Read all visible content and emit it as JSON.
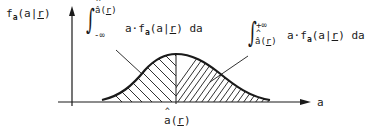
{
  "diagram": {
    "y_axis_label": {
      "fn": "f",
      "sub": "a",
      "args_pre": "(a|",
      "arg_r": "r",
      "args_post": ")"
    },
    "x_axis_label": "a",
    "split_label": {
      "base": "a",
      "open": "(",
      "arg": "r",
      "close": ")"
    },
    "left_integral": {
      "upper": "â(r)",
      "upper_base": "â(",
      "upper_arg": "r",
      "upper_close": ")",
      "lower": "-∞",
      "integrand_pre": "a·f",
      "integrand_sub": "a",
      "integrand_args_pre": "(a|",
      "integrand_arg": "r",
      "integrand_args_post": ")",
      "differential": "da"
    },
    "right_integral": {
      "upper": "+∞",
      "lower_base": "â(",
      "lower_arg": "r",
      "lower_close": ")",
      "integrand_pre": "a·f",
      "integrand_sub": "a",
      "integrand_args_pre": "(a|",
      "integrand_arg": "r",
      "integrand_args_post": ")",
      "differential": "da"
    },
    "colors": {
      "ink": "#1a1a1a",
      "background": "#ffffff"
    }
  }
}
